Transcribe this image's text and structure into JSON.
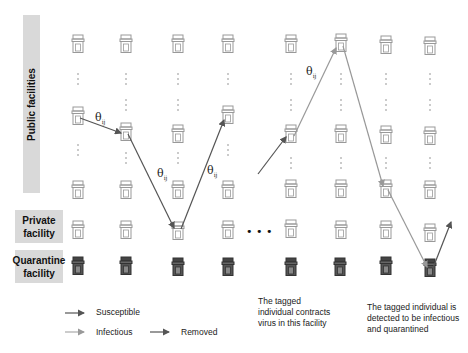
{
  "row_labels": {
    "public": "Public facilities",
    "private_line1": "Private",
    "private_line2": "facility",
    "quarantine_line1": "Quarantine",
    "quarantine_line2": "facility"
  },
  "edge_labels": {
    "theta": "θ",
    "subscript": "ij"
  },
  "ellipsis": "• • •",
  "legend": {
    "susceptible": "Susceptible",
    "infectious": "Infectious",
    "removed": "Removed",
    "colors": {
      "susceptible": "#555555",
      "infectious": "#aaaaaa",
      "removed": "#555555"
    }
  },
  "notes": {
    "contracts_line1": "The tagged",
    "contracts_line2": "individual contracts",
    "contracts_line3": "virus in this facility",
    "quarantined_line1": "The tagged individual is",
    "quarantined_line2": "detected to be infectious",
    "quarantined_line3": "and quarantined"
  },
  "colors": {
    "label_bg": "#d9d9d9",
    "facility_light": "#aaaaaa",
    "facility_dark": "#444444"
  }
}
